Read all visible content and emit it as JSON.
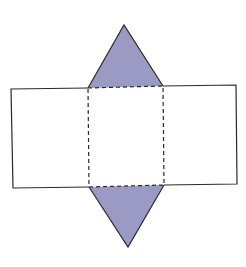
{
  "diagram": {
    "title": "Net of a triangular prism",
    "colors": {
      "triangle_fill": "#9b9ac4",
      "stroke": "#2a2a2a",
      "background": "#ffffff"
    },
    "shapes": {
      "top_triangle": {
        "points": "124,25 88,88 163,86"
      },
      "bottom_triangle": {
        "points": "89,187 164,185 128,247"
      },
      "left_rectangle": {
        "points": "88,88 11,89 13,188 89,187"
      },
      "right_rectangle": {
        "points": "163,86 236,85 237,184 164,185"
      },
      "center_square_fold": {
        "points": "88,88 163,86 164,185 89,187"
      }
    }
  }
}
